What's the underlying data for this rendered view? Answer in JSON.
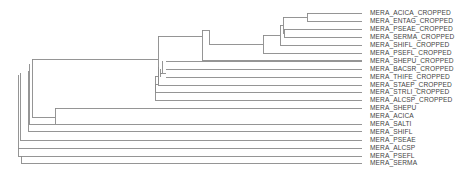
{
  "diagram": {
    "type": "phylogenetic-tree",
    "line_color": "#8a8a8a",
    "label_color": "#444444",
    "leaves": [
      "MERA_ACICA_CROPPED",
      "MERA_ENTAG_CROPPED",
      "MERA_PSEAE_CROPPED",
      "MERA_SERMA_CROPPED",
      "MERA_SHIFL_CROPPED",
      "MERA_PSEFL_CROPPED",
      "MERA_SHEPU_CROPPED",
      "MERA_BACSR_CROPPED",
      "MERA_THIFE_CROPPED",
      "MERA_STAEP_CROPPED",
      "MERA_STRLI_CROPPED",
      "MERA_ALCSP_CROPPED",
      "MERA_SHEPU",
      "MERA_ACICA",
      "MERA_SALTI",
      "MERA_SHIFL",
      "MERA_PSEAE",
      "MERA_ALCSP",
      "MERA_PSEFL",
      "MERA_SERMA"
    ]
  }
}
